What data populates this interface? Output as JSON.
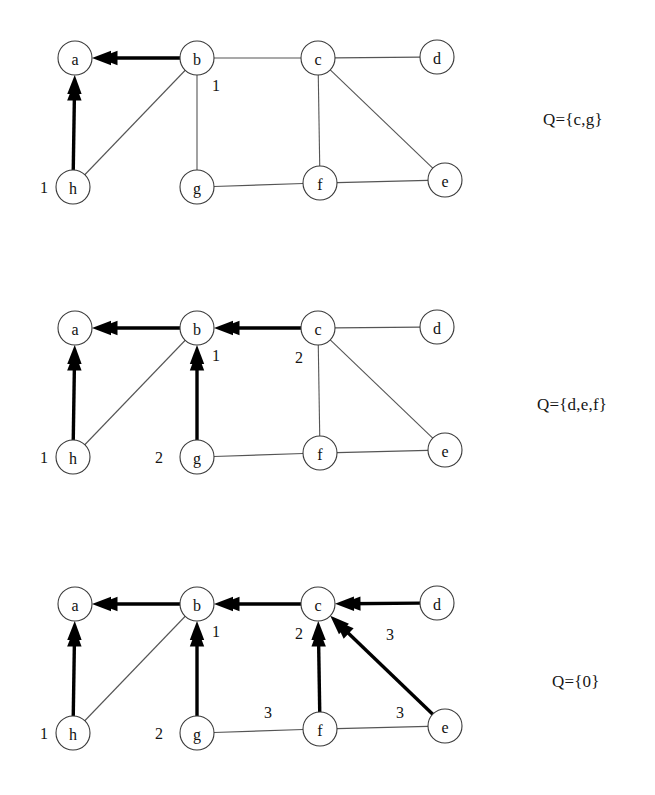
{
  "figure": {
    "type": "diagram",
    "node_ids": [
      "a",
      "b",
      "c",
      "d",
      "e",
      "f",
      "g",
      "h"
    ],
    "node_positions": {
      "a": {
        "x": 75,
        "y": 58
      },
      "b": {
        "x": 197,
        "y": 58
      },
      "c": {
        "x": 318,
        "y": 58
      },
      "d": {
        "x": 437,
        "y": 57
      },
      "e": {
        "x": 445,
        "y": 180
      },
      "f": {
        "x": 320,
        "y": 183
      },
      "g": {
        "x": 197,
        "y": 187
      },
      "h": {
        "x": 73,
        "y": 187
      }
    },
    "node_radius": 17,
    "base_edges": [
      {
        "from": "a",
        "to": "b"
      },
      {
        "from": "b",
        "to": "c"
      },
      {
        "from": "c",
        "to": "d"
      },
      {
        "from": "b",
        "to": "h"
      },
      {
        "from": "b",
        "to": "g"
      },
      {
        "from": "c",
        "to": "f"
      },
      {
        "from": "c",
        "to": "e"
      },
      {
        "from": "a",
        "to": "h"
      },
      {
        "from": "g",
        "to": "f"
      },
      {
        "from": "f",
        "to": "e"
      }
    ]
  },
  "panels": [
    {
      "id": "panel-1",
      "top": 0,
      "queue_label": "Q={c,g}",
      "queue_label_x": 543,
      "queue_label_y": 110,
      "tree_edges": [
        {
          "from": "b",
          "to": "a"
        },
        {
          "from": "h",
          "to": "a"
        }
      ],
      "weights": [
        {
          "value": "1",
          "x": 216,
          "y": 85
        },
        {
          "value": "1",
          "x": 44,
          "y": 187
        }
      ]
    },
    {
      "id": "panel-2",
      "top": 270,
      "queue_label": "Q={d,e,f}",
      "queue_label_x": 537,
      "queue_label_y": 395,
      "tree_edges": [
        {
          "from": "b",
          "to": "a"
        },
        {
          "from": "h",
          "to": "a"
        },
        {
          "from": "c",
          "to": "b"
        },
        {
          "from": "g",
          "to": "b"
        }
      ],
      "weights": [
        {
          "value": "1",
          "x": 216,
          "y": 85
        },
        {
          "value": "1",
          "x": 44,
          "y": 187
        },
        {
          "value": "2",
          "x": 299,
          "y": 87
        },
        {
          "value": "2",
          "x": 159,
          "y": 187
        }
      ]
    },
    {
      "id": "panel-3",
      "top": 546,
      "queue_label": "Q={0}",
      "queue_label_x": 552,
      "queue_label_y": 672,
      "tree_edges": [
        {
          "from": "b",
          "to": "a"
        },
        {
          "from": "h",
          "to": "a"
        },
        {
          "from": "c",
          "to": "b"
        },
        {
          "from": "g",
          "to": "b"
        },
        {
          "from": "d",
          "to": "c"
        },
        {
          "from": "f",
          "to": "c"
        },
        {
          "from": "e",
          "to": "c"
        }
      ],
      "weights": [
        {
          "value": "1",
          "x": 216,
          "y": 85
        },
        {
          "value": "1",
          "x": 44,
          "y": 187
        },
        {
          "value": "2",
          "x": 299,
          "y": 87
        },
        {
          "value": "2",
          "x": 159,
          "y": 187
        },
        {
          "value": "3",
          "x": 390,
          "y": 88
        },
        {
          "value": "3",
          "x": 268,
          "y": 166
        },
        {
          "value": "3",
          "x": 400,
          "y": 166
        }
      ]
    }
  ]
}
